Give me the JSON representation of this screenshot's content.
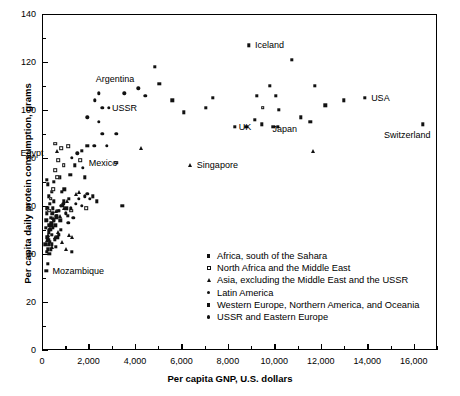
{
  "chart_data": {
    "type": "scatter",
    "title": "",
    "xlabel": "Per capita GNP, U.S. dollars",
    "ylabel": "Per capita daily protein consumption, grams",
    "xlim": [
      0,
      17000
    ],
    "ylim": [
      0,
      140
    ],
    "x_major_ticks": [
      0,
      2000,
      4000,
      6000,
      8000,
      10000,
      12000,
      14000,
      16000
    ],
    "x_tick_labels": [
      "0",
      "2,000",
      "4,000",
      "6,000",
      "8,000",
      "10,000",
      "12,000",
      "14,000",
      "16,000"
    ],
    "x_minor_ticks": [
      1000,
      3000,
      5000,
      7000,
      9000,
      11000,
      13000,
      15000,
      17000
    ],
    "y_major_ticks": [
      0,
      20,
      40,
      60,
      80,
      100,
      120,
      140
    ],
    "y_tick_labels": [
      "0",
      "20",
      "40",
      "60",
      "80",
      "100",
      "120",
      "140"
    ],
    "y_minor_ticks": [
      10,
      30,
      50,
      70,
      90,
      110,
      130
    ],
    "grid": false,
    "legend_position": "inside-lower-right",
    "legend": [
      {
        "label": "Africa, south of the Sahara",
        "marker": "sq"
      },
      {
        "label": "North Africa and the Middle East",
        "marker": "osq"
      },
      {
        "label": "Asia, excluding the Middle East and the USSR",
        "marker": "tri"
      },
      {
        "label": "Latin America",
        "marker": "dot"
      },
      {
        "label": "Western Europe, Northern America, and Oceania",
        "marker": "sq"
      },
      {
        "label": "USSR and Eastern Europe",
        "marker": "dot"
      }
    ],
    "annotations": [
      {
        "text": "Argentina",
        "x": 2100,
        "y": 113,
        "align": "right"
      },
      {
        "text": "USSR",
        "x": 2800,
        "y": 101,
        "align": "right"
      },
      {
        "text": "Egypt",
        "x": 450,
        "y": 82,
        "align": "left"
      },
      {
        "text": "Mexico",
        "x": 1800,
        "y": 78,
        "align": "right"
      },
      {
        "text": "Singapore",
        "x": 6450,
        "y": 77,
        "align": "right"
      },
      {
        "text": "Iceland",
        "x": 8950,
        "y": 127,
        "align": "right"
      },
      {
        "text": "UK",
        "x": 8250,
        "y": 93,
        "align": "right"
      },
      {
        "text": "Japan",
        "x": 9700,
        "y": 92,
        "align": "right"
      },
      {
        "text": "USA",
        "x": 13950,
        "y": 105,
        "align": "right"
      },
      {
        "text": "Switzerland",
        "x": 16350,
        "y": 94,
        "align": "left-below"
      },
      {
        "text": "Mozambique",
        "x": 240,
        "y": 33,
        "align": "right"
      }
    ],
    "series": [
      {
        "name": "Africa, south of the Sahara",
        "marker": "sq",
        "points": [
          [
            180,
            33
          ],
          [
            250,
            36
          ],
          [
            200,
            41
          ],
          [
            260,
            42
          ],
          [
            300,
            44
          ],
          [
            330,
            45
          ],
          [
            230,
            47
          ],
          [
            280,
            49
          ],
          [
            350,
            50
          ],
          [
            310,
            52
          ],
          [
            400,
            53
          ],
          [
            430,
            48
          ],
          [
            470,
            51
          ],
          [
            380,
            55
          ],
          [
            450,
            57
          ],
          [
            520,
            54
          ],
          [
            560,
            46
          ],
          [
            600,
            43
          ],
          [
            640,
            56
          ],
          [
            700,
            58
          ],
          [
            340,
            61
          ],
          [
            290,
            64
          ],
          [
            420,
            66
          ],
          [
            240,
            69
          ],
          [
            200,
            71
          ],
          [
            520,
            70
          ],
          [
            760,
            72
          ],
          [
            880,
            60
          ],
          [
            930,
            62
          ],
          [
            1050,
            59
          ],
          [
            1280,
            41
          ],
          [
            1100,
            56
          ],
          [
            820,
            50
          ],
          [
            660,
            47
          ],
          [
            150,
            44
          ],
          [
            170,
            51
          ],
          [
            190,
            54
          ],
          [
            210,
            57
          ],
          [
            230,
            59
          ],
          [
            270,
            46
          ],
          [
            310,
            40
          ],
          [
            370,
            42
          ],
          [
            410,
            44
          ],
          [
            460,
            59
          ],
          [
            500,
            62
          ],
          [
            580,
            52
          ],
          [
            620,
            55
          ],
          [
            720,
            48
          ],
          [
            780,
            54
          ],
          [
            860,
            66
          ],
          [
            960,
            67
          ],
          [
            1150,
            63
          ],
          [
            1400,
            77
          ],
          [
            1700,
            83
          ],
          [
            1950,
            85
          ],
          [
            2350,
            62
          ],
          [
            2180,
            64
          ],
          [
            3450,
            60
          ],
          [
            1220,
            73
          ],
          [
            1850,
            72
          ]
        ]
      },
      {
        "name": "North Africa and the Middle East",
        "marker": "osq",
        "points": [
          [
            380,
            63
          ],
          [
            470,
            67
          ],
          [
            560,
            75
          ],
          [
            660,
            72
          ],
          [
            700,
            79
          ],
          [
            820,
            84
          ],
          [
            930,
            77
          ],
          [
            1130,
            85
          ],
          [
            1260,
            58
          ],
          [
            1650,
            79
          ],
          [
            1900,
            59
          ],
          [
            3200,
            78
          ],
          [
            9500,
            101
          ],
          [
            560,
            86
          ],
          [
            300,
            58
          ]
        ]
      },
      {
        "name": "Asia, excluding the Middle East and the USSR",
        "marker": "tri",
        "points": [
          [
            160,
            44
          ],
          [
            210,
            46
          ],
          [
            260,
            48
          ],
          [
            330,
            51
          ],
          [
            390,
            53
          ],
          [
            430,
            43
          ],
          [
            480,
            55
          ],
          [
            560,
            47
          ],
          [
            610,
            58
          ],
          [
            680,
            49
          ],
          [
            760,
            56
          ],
          [
            840,
            45
          ],
          [
            930,
            59
          ],
          [
            1030,
            42
          ],
          [
            1160,
            48
          ],
          [
            1290,
            47
          ],
          [
            660,
            83
          ],
          [
            1080,
            62
          ],
          [
            6350,
            77
          ],
          [
            4280,
            84
          ],
          [
            11650,
            83
          ],
          [
            1480,
            65
          ],
          [
            1580,
            66
          ]
        ]
      },
      {
        "name": "Latin America",
        "marker": "dot",
        "points": [
          [
            320,
            50
          ],
          [
            420,
            52
          ],
          [
            520,
            54
          ],
          [
            620,
            56
          ],
          [
            720,
            58
          ],
          [
            820,
            60
          ],
          [
            920,
            61
          ],
          [
            1020,
            57
          ],
          [
            1130,
            53
          ],
          [
            1240,
            59
          ],
          [
            1340,
            55
          ],
          [
            1460,
            61
          ],
          [
            1580,
            63
          ],
          [
            1700,
            60
          ],
          [
            1850,
            64
          ],
          [
            1950,
            65
          ],
          [
            2050,
            63
          ],
          [
            1280,
            80
          ],
          [
            2250,
            85
          ],
          [
            1750,
            76
          ],
          [
            1520,
            82
          ],
          [
            2600,
            90
          ],
          [
            2450,
            107
          ]
        ]
      },
      {
        "name": "Western Europe, Northern America, and Oceania",
        "marker": "sq",
        "points": [
          [
            8900,
            127
          ],
          [
            10750,
            121
          ],
          [
            9800,
            110
          ],
          [
            11750,
            110
          ],
          [
            7350,
            105
          ],
          [
            10050,
            106
          ],
          [
            13000,
            104
          ],
          [
            13900,
            105
          ],
          [
            16400,
            94
          ],
          [
            9250,
            106
          ],
          [
            10200,
            100
          ],
          [
            9150,
            96
          ],
          [
            8300,
            93
          ],
          [
            8800,
            93
          ],
          [
            9450,
            94
          ],
          [
            9950,
            93
          ],
          [
            10150,
            93
          ],
          [
            11150,
            97
          ],
          [
            11550,
            95
          ],
          [
            12200,
            102
          ],
          [
            5050,
            111
          ],
          [
            6100,
            99
          ],
          [
            7050,
            101
          ],
          [
            4850,
            118
          ],
          [
            5600,
            104
          ]
        ]
      },
      {
        "name": "USSR and Eastern Europe",
        "marker": "dot",
        "points": [
          [
            2880,
            101
          ],
          [
            3550,
            107
          ],
          [
            4150,
            109
          ],
          [
            4450,
            106
          ],
          [
            2280,
            104
          ],
          [
            2600,
            101
          ],
          [
            2450,
            95
          ],
          [
            1950,
            97
          ],
          [
            3200,
            90
          ],
          [
            2800,
            85
          ]
        ]
      }
    ]
  }
}
